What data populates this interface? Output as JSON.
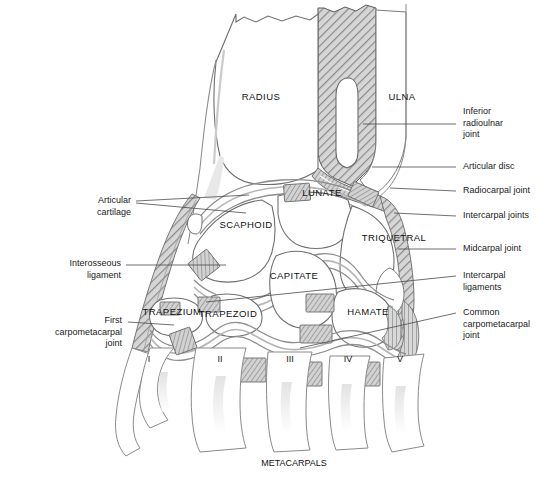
{
  "figure": {
    "title_caption": "METACARPALS",
    "domain": "anatomical-diagram",
    "colors": {
      "outline": "#555555",
      "cartilage_fill": "#cfcfcf",
      "ligament_fill": "#b9b9b9",
      "hatch_dark": "#8c8c8c",
      "hatch_light": "#c8c8c8",
      "background": "#ffffff",
      "text": "#1a1a1a",
      "leader_line": "#4a4a4a"
    }
  },
  "bones": [
    {
      "id": "radius",
      "label": "RADIUS",
      "x": 261,
      "y": 100
    },
    {
      "id": "ulna",
      "label": "ULNA",
      "x": 388,
      "y": 100
    },
    {
      "id": "lunate",
      "label": "LUNATE",
      "x": 322,
      "y": 196
    },
    {
      "id": "scaphoid",
      "label": "SCAPHOID",
      "x": 228,
      "y": 228
    },
    {
      "id": "triquetral",
      "label": "TRIQUETRAL",
      "x": 367,
      "y": 241
    },
    {
      "id": "capitate",
      "label": "CAPITATE",
      "x": 268,
      "y": 279
    },
    {
      "id": "trapezium",
      "label": "TRAPEZIUM",
      "x": 146,
      "y": 315
    },
    {
      "id": "trapezoid",
      "label": "TRAPEZOID",
      "x": 205,
      "y": 317
    },
    {
      "id": "hamate",
      "label": "HAMATE",
      "x": 352,
      "y": 315
    }
  ],
  "metacarpals": {
    "caption": "METACARPALS",
    "caption_x": 258,
    "caption_y": 464,
    "numerals": [
      {
        "label": "I",
        "x": 146,
        "y": 360
      },
      {
        "label": "II",
        "x": 218,
        "y": 360
      },
      {
        "label": "III",
        "x": 290,
        "y": 360
      },
      {
        "label": "IV",
        "x": 348,
        "y": 360
      },
      {
        "label": "V",
        "x": 398,
        "y": 360
      }
    ]
  },
  "labels_right": [
    {
      "id": "inferior-radioulnar-joint",
      "lines": [
        "Inferior",
        "radioulnar",
        "joint"
      ],
      "text_x": 463,
      "text_y": 112,
      "leader": {
        "x1": 455,
        "y1": 124,
        "x2": 363,
        "y2": 124
      }
    },
    {
      "id": "articular-disc",
      "lines": [
        "Articular disc"
      ],
      "text_x": 463,
      "text_y": 163,
      "leader": {
        "x1": 455,
        "y1": 167,
        "x2": 370,
        "y2": 167
      }
    },
    {
      "id": "radiocarpal-joint",
      "lines": [
        "Radiocarpal joint"
      ],
      "text_x": 463,
      "text_y": 188,
      "leader": {
        "x1": 455,
        "y1": 192,
        "x2": 388,
        "y2": 188
      }
    },
    {
      "id": "intercarpal-joints",
      "lines": [
        "Intercarpal joints"
      ],
      "text_x": 463,
      "text_y": 213,
      "leader": {
        "x1": 455,
        "y1": 217,
        "x2": 392,
        "y2": 214
      }
    },
    {
      "id": "midcarpal-joint",
      "lines": [
        "Midcarpal joint"
      ],
      "text_x": 463,
      "text_y": 246,
      "leader": {
        "x1": 455,
        "y1": 250,
        "x2": 398,
        "y2": 250
      }
    },
    {
      "id": "intercarpal-ligaments",
      "lines": [
        "Intercarpal",
        "ligaments"
      ],
      "text_x": 463,
      "text_y": 270,
      "leader": {
        "x1": 455,
        "y1": 277,
        "x2": 205,
        "y2": 300
      }
    },
    {
      "id": "common-carpometacarpal-joint",
      "lines": [
        "Common",
        "carpometacarpal",
        "joint"
      ],
      "text_x": 463,
      "text_y": 308,
      "leader": {
        "x1": 455,
        "y1": 314,
        "x2": 300,
        "y2": 348
      }
    }
  ],
  "labels_left": [
    {
      "id": "articular-cartilage",
      "lines": [
        "Articular",
        "cartilage"
      ],
      "text_right_x": 131,
      "text_y": 196,
      "leaders": [
        {
          "x1": 136,
          "y1": 202,
          "x2": 248,
          "y2": 196
        },
        {
          "x1": 136,
          "y1": 204,
          "x2": 245,
          "y2": 212
        }
      ]
    },
    {
      "id": "interosseous-ligament",
      "lines": [
        "Interosseous",
        "ligament"
      ],
      "text_right_x": 121,
      "text_y": 259,
      "leaders": [
        {
          "x1": 126,
          "y1": 265,
          "x2": 225,
          "y2": 265
        }
      ]
    },
    {
      "id": "first-carpometacarpal-joint",
      "lines": [
        "First",
        "carpometacarpal",
        "joint"
      ],
      "text_right_x": 122,
      "text_y": 316,
      "leaders": [
        {
          "x1": 127,
          "y1": 322,
          "x2": 172,
          "y2": 324
        }
      ]
    }
  ]
}
